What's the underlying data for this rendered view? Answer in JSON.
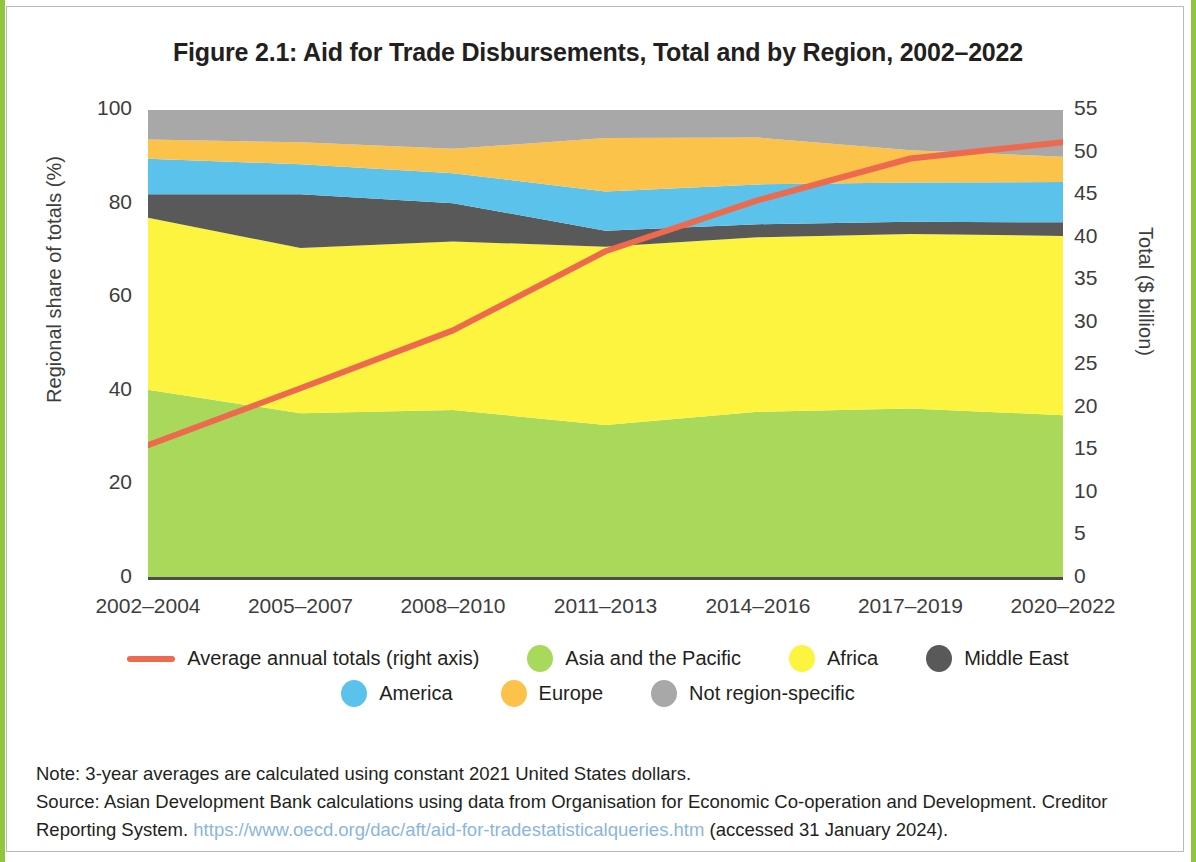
{
  "figure": {
    "title": "Figure 2.1: Aid for Trade Disbursements, Total and by Region, 2002–2022"
  },
  "notes": {
    "note_line": "Note: 3-year averages are calculated using constant 2021 United States dollars.",
    "source_line_1": "Source: Asian Development Bank calculations using data from Organisation for Economic Co-operation and Development. Creditor",
    "source_line_2_prefix": "Reporting System. ",
    "source_url": "https://www.oecd.org/dac/aft/aid-for-tradestatisticalqueries.htm",
    "source_line_2_suffix": " (accessed 31 January 2024)."
  },
  "colors": {
    "asia_pacific": "#a9d95a",
    "africa": "#fdf43f",
    "middle_east": "#595959",
    "america": "#5bc2ec",
    "europe": "#fbc34a",
    "not_region_specific": "#a8a8a8",
    "total_line": "#ed6a4f",
    "axis": "#4d4d4d",
    "url": "#8ab6dd"
  },
  "legend": {
    "rows": [
      [
        {
          "label": "Average annual totals (right axis)",
          "marker": "line",
          "color": "#ed6a4f",
          "name": "legend-average-annual-totals"
        },
        {
          "label": "Asia and the Pacific",
          "marker": "dot",
          "color": "#a9d95a",
          "name": "legend-asia-and-the-pacific"
        },
        {
          "label": "Africa",
          "marker": "dot",
          "color": "#fdf43f",
          "name": "legend-africa"
        },
        {
          "label": "Middle East",
          "marker": "dot",
          "color": "#595959",
          "name": "legend-middle-east"
        }
      ],
      [
        {
          "label": "America",
          "marker": "dot",
          "color": "#5bc2ec",
          "name": "legend-america"
        },
        {
          "label": "Europe",
          "marker": "dot",
          "color": "#fbc34a",
          "name": "legend-europe"
        },
        {
          "label": "Not region-specific",
          "marker": "dot",
          "color": "#a8a8a8",
          "name": "legend-not-region-specific"
        }
      ]
    ]
  },
  "chart_data": {
    "type": "area",
    "title": "Figure 2.1: Aid for Trade Disbursements, Total and by Region, 2002–2022",
    "xlabel": "",
    "ylabel": "Regional share of totals (%)",
    "ylabel_right": "Total ($ billion)",
    "categories": [
      "2002–2004",
      "2005–2007",
      "2008–2010",
      "2011–2013",
      "2014–2016",
      "2017–2019",
      "2020–2022"
    ],
    "ylim": [
      0,
      100
    ],
    "yticks": [
      0,
      20,
      40,
      60,
      80,
      100
    ],
    "ylim_right": [
      0,
      55
    ],
    "yticks_right": [
      0,
      5,
      10,
      15,
      20,
      25,
      30,
      35,
      40,
      45,
      50,
      55
    ],
    "grid": false,
    "legend_position": "bottom",
    "stack_order": [
      "Asia and the Pacific",
      "Africa",
      "Middle East",
      "America",
      "Europe",
      "Not region-specific"
    ],
    "series": [
      {
        "name": "Asia and the Pacific",
        "color": "#a9d95a",
        "axis": "left",
        "type": "area",
        "values": [
          40.2,
          35.2,
          35.9,
          32.7,
          35.5,
          36.2,
          34.8
        ]
      },
      {
        "name": "Africa",
        "color": "#fdf43f",
        "axis": "left",
        "type": "area",
        "values": [
          36.8,
          35.3,
          36.0,
          38.1,
          37.3,
          37.3,
          38.3
        ]
      },
      {
        "name": "Middle East",
        "color": "#595959",
        "axis": "left",
        "type": "area",
        "values": [
          5.0,
          11.5,
          8.2,
          3.4,
          2.8,
          2.6,
          2.9
        ]
      },
      {
        "name": "America",
        "color": "#5bc2ec",
        "axis": "left",
        "type": "area",
        "values": [
          7.6,
          6.4,
          6.4,
          8.4,
          8.5,
          8.4,
          8.6
        ]
      },
      {
        "name": "Europe",
        "color": "#fbc34a",
        "axis": "left",
        "type": "area",
        "values": [
          4.1,
          4.7,
          5.2,
          11.4,
          10.0,
          6.9,
          5.4
        ]
      },
      {
        "name": "Not region-specific",
        "color": "#a8a8a8",
        "axis": "left",
        "type": "area",
        "values": [
          6.3,
          6.9,
          8.3,
          6.0,
          5.9,
          8.6,
          10.0
        ]
      },
      {
        "name": "Average annual totals (right axis)",
        "color": "#ed6a4f",
        "axis": "right",
        "type": "line",
        "values": [
          15.6,
          22.3,
          29.1,
          38.4,
          44.4,
          49.3,
          51.2
        ]
      }
    ]
  }
}
